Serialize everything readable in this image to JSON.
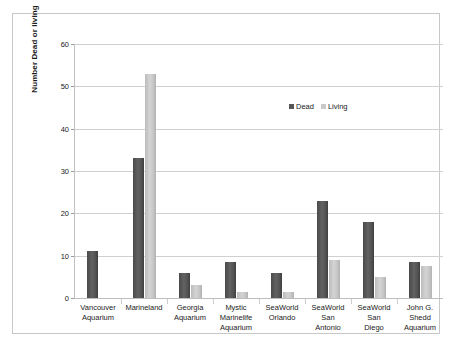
{
  "chart_data": {
    "type": "bar",
    "title": "",
    "xlabel": "",
    "ylabel": "Number Dead or living",
    "ylim": [
      0,
      60
    ],
    "yticks": [
      0,
      10,
      20,
      30,
      40,
      50,
      60
    ],
    "grid": true,
    "legend_position": "inside-upper-right",
    "categories": [
      "Vancouver Aquarium",
      "Marineland",
      "Georgia Aquarium",
      "Mystic Marinelife Aquarium",
      "SeaWorld Orlando",
      "SeaWorld San Antonio",
      "SeaWorld San Diego",
      "John G. Shedd Aquarium"
    ],
    "category_lines": [
      [
        "Vancouver",
        "Aquarium"
      ],
      [
        "Marineland"
      ],
      [
        "Georgia",
        "Aquarium"
      ],
      [
        "Mystic",
        "Marinelife",
        "Aquarium"
      ],
      [
        "SeaWorld",
        "Orlando"
      ],
      [
        "SeaWorld",
        "San",
        "Antonio"
      ],
      [
        "SeaWorld",
        "San",
        "Diego"
      ],
      [
        "John G.",
        "Shedd",
        "Aquarium"
      ]
    ],
    "series": [
      {
        "name": "Dead",
        "color": "#565656",
        "values": [
          11,
          33,
          6,
          8.5,
          6,
          23,
          18,
          8.5
        ]
      },
      {
        "name": "Living",
        "color": "#c9c9c9",
        "values": [
          0,
          53,
          3,
          1.5,
          1.5,
          9,
          5,
          7.5
        ]
      }
    ]
  },
  "axis": {
    "y_title": "Number Dead or living",
    "y_tick_labels": [
      "0",
      "10",
      "20",
      "30",
      "40",
      "50",
      "60"
    ]
  },
  "legend": {
    "items": [
      {
        "label": "Dead",
        "swatch": "dead-swatch"
      },
      {
        "label": "Living",
        "swatch": "living-swatch"
      }
    ]
  }
}
